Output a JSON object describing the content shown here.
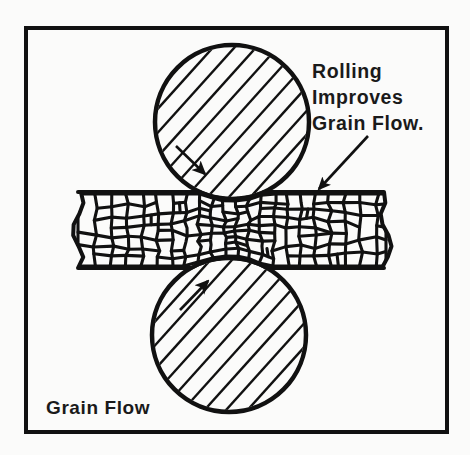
{
  "figure": {
    "kind": "technical-line-diagram",
    "background_color": "#fbfbfa",
    "ink_color": "#111111",
    "frame": {
      "name": "outer-border",
      "x": 26,
      "y": 28,
      "width": 421,
      "height": 404,
      "stroke_width": 4,
      "color": "#111111"
    },
    "annotation": {
      "name": "callout",
      "lines": [
        "Rolling",
        "Improves",
        "Grain Flow."
      ],
      "full_text": "Rolling Improves Grain Flow.",
      "x": 312,
      "y": 78,
      "line_height": 26,
      "font_size": 19.5,
      "color": "#1a1a1a",
      "leader": {
        "from_x": 368,
        "from_y": 136,
        "to_x": 317,
        "to_y": 191,
        "stroke_width": 2.6,
        "arrowhead": "filled-triangle"
      }
    },
    "corner_label": {
      "name": "grain-flow-label",
      "text": "Grain Flow",
      "x": 46,
      "y": 414,
      "font_size": 19,
      "color": "#1a1a1a"
    },
    "rollers": [
      {
        "name": "upper-roller",
        "position": "top",
        "cx": 232,
        "cy": 122,
        "r": 77,
        "stroke_width": 4.5,
        "hatch_angle_deg": -48,
        "hatch_spacing": 16,
        "hatch_stroke": 2.4,
        "rotation_arrow": {
          "label": "clockwise",
          "from_x": 176,
          "from_y": 146,
          "to_x": 205,
          "to_y": 174,
          "stroke_width": 2.6
        }
      },
      {
        "name": "lower-roller",
        "position": "bottom",
        "cx": 229,
        "cy": 335,
        "r": 77,
        "stroke_width": 4.5,
        "hatch_angle_deg": -48,
        "hatch_spacing": 16,
        "hatch_stroke": 2.4,
        "rotation_arrow": {
          "label": "counter-clockwise",
          "from_x": 180,
          "from_y": 310,
          "to_x": 208,
          "to_y": 281,
          "stroke_width": 2.6
        }
      }
    ],
    "workpiece": {
      "name": "metal-strip",
      "description": "grain-structured sheet being rolled",
      "left_x": 78,
      "right_x": 386,
      "top_y": 192,
      "bottom_y": 268,
      "entry_thickness": 76,
      "exit_thickness": 70,
      "nip_center_x": 231,
      "outline_stroke": 4,
      "grain_stroke": 3.1,
      "grain_fill": "#fbfbfa",
      "grain_line_color": "#111111",
      "edges": "torn-wavy-left-and-right"
    }
  },
  "chart_data": {
    "type": "diagram",
    "title": "Grain Flow",
    "annotations": [
      "Rolling Improves Grain Flow."
    ]
  }
}
